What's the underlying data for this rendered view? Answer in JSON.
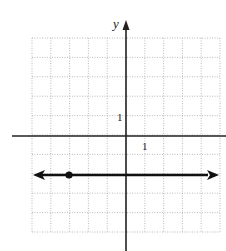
{
  "chart_data": {
    "type": "line",
    "title": "",
    "xlabel": "",
    "ylabel": "y",
    "xlim": [
      -5,
      5
    ],
    "ylim": [
      -5,
      5
    ],
    "grid": true,
    "tick_labels": {
      "x": "1",
      "y": "1"
    },
    "series": [
      {
        "name": "horizontal line",
        "equation": "y = -2",
        "x": [
          -5,
          5
        ],
        "y": [
          -2,
          -2
        ],
        "arrows_both_ends": true
      }
    ],
    "points": [
      {
        "x": -3,
        "y": -2,
        "filled": true
      }
    ]
  },
  "labels": {
    "y_axis": "y",
    "x_tick": "1",
    "y_tick": "1"
  },
  "colors": {
    "axis": "#222222",
    "grid": "#aaaaaa",
    "line": "#111111"
  }
}
